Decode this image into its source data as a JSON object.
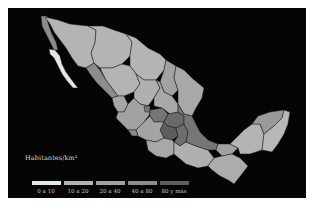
{
  "map": {
    "subject": "Mexico population density by state",
    "background_color": "#050505",
    "border_color": "#1a1a1a"
  },
  "legend": {
    "title": "Habitantes/km²",
    "items": [
      {
        "label": "0 a 10",
        "color": "#e6e6e6"
      },
      {
        "label": "10 a 20",
        "color": "#b4b4b4"
      },
      {
        "label": "20 a 40",
        "color": "#a2a2a2"
      },
      {
        "label": "40 a 80",
        "color": "#8c8c8c"
      },
      {
        "label": "80 y más",
        "color": "#5e5e5e"
      }
    ]
  },
  "regions": [
    {
      "name": "Baja California",
      "class": "20 a 40",
      "color": "#8c8c8c"
    },
    {
      "name": "Baja California Sur",
      "class": "0 a 10",
      "color": "#e6e6e6"
    },
    {
      "name": "Sonora",
      "class": "10 a 20",
      "color": "#b4b4b4"
    },
    {
      "name": "Chihuahua",
      "class": "10 a 20",
      "color": "#b4b4b4"
    },
    {
      "name": "Coahuila",
      "class": "10 a 20",
      "color": "#b4b4b4"
    },
    {
      "name": "Nuevo León",
      "class": "40 a 80",
      "color": "#a2a2a2"
    },
    {
      "name": "Tamaulipas",
      "class": "20 a 40",
      "color": "#a8a8a8"
    },
    {
      "name": "Sinaloa",
      "class": "40 a 80",
      "color": "#8c8c8c"
    },
    {
      "name": "Durango",
      "class": "10 a 20",
      "color": "#b4b4b4"
    },
    {
      "name": "Zacatecas",
      "class": "20 a 40",
      "color": "#b0b0b0"
    },
    {
      "name": "Nayarit",
      "class": "20 a 40",
      "color": "#a6a6a6"
    },
    {
      "name": "Jalisco",
      "class": "40 a 80",
      "color": "#a2a2a2"
    },
    {
      "name": "Central states",
      "class": "80 y más",
      "color": "#5e5e5e"
    },
    {
      "name": "Guerrero",
      "class": "40 a 80",
      "color": "#a8a8a8"
    },
    {
      "name": "Oaxaca",
      "class": "20 a 40",
      "color": "#b0b0b0"
    },
    {
      "name": "Veracruz",
      "class": "80 y más",
      "color": "#767676"
    },
    {
      "name": "Chiapas",
      "class": "40 a 80",
      "color": "#acacac"
    },
    {
      "name": "Tabasco",
      "class": "40 a 80",
      "color": "#a0a0a0"
    },
    {
      "name": "Campeche",
      "class": "10 a 20",
      "color": "#b4b4b4"
    },
    {
      "name": "Yucatán",
      "class": "20 a 40",
      "color": "#9a9a9a"
    },
    {
      "name": "Quintana Roo",
      "class": "0 a 10",
      "color": "#b8b8b8"
    }
  ]
}
